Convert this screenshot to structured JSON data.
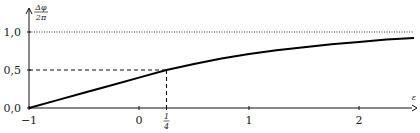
{
  "chart_data": {
    "type": "line",
    "title": "",
    "xlabel": "ε",
    "ylabel": "Δφ / 2π",
    "ylabel_num": "Δφ",
    "ylabel_den": "2π",
    "xlim": [
      -1,
      2.5
    ],
    "ylim": [
      0,
      1.05
    ],
    "grid": false,
    "x_ticks": [
      {
        "value": -1,
        "label": "−1"
      },
      {
        "value": 0,
        "label": "0"
      },
      {
        "value": 0.25,
        "label_num": "1",
        "label_den": "4"
      },
      {
        "value": 1,
        "label": "1"
      },
      {
        "value": 2,
        "label": "2"
      }
    ],
    "y_ticks": [
      {
        "value": 0,
        "label": "0,0"
      },
      {
        "value": 0.5,
        "label": "0,5"
      },
      {
        "value": 1,
        "label": "1,0"
      }
    ],
    "series": [
      {
        "name": "Δφ/2π",
        "style": "solid",
        "x": [
          -1,
          -0.75,
          -0.5,
          -0.25,
          0,
          0.25,
          0.5,
          0.75,
          1,
          1.25,
          1.5,
          1.75,
          2,
          2.25,
          2.5
        ],
        "y": [
          0,
          0.1,
          0.2,
          0.3,
          0.4,
          0.5,
          0.58,
          0.65,
          0.71,
          0.76,
          0.8,
          0.84,
          0.87,
          0.9,
          0.92
        ]
      }
    ],
    "annotations": [
      {
        "type": "hline",
        "y": 1.0,
        "style": "dotted",
        "label": "asymptote"
      },
      {
        "type": "dashed-guide",
        "x": 0.25,
        "y": 0.5
      }
    ]
  }
}
